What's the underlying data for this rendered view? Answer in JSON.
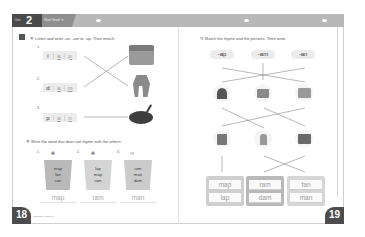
{
  "header": {
    "unit_label": "Unit",
    "unit_number": "2",
    "title": "Short Vowel ⑧"
  },
  "left_page": {
    "page_number": "18",
    "footer_text": "Phonics 1, Book 2",
    "exercise1": {
      "icon": "audio-track-icon",
      "instruction": "⑧ Listen and write -an, -am or -ap. Then match.",
      "items": [
        {
          "number": "1.",
          "first_letter": "l",
          "fill": [
            "a",
            "p"
          ],
          "matches_picture": "dog"
        },
        {
          "number": "2.",
          "first_letter": "d",
          "fill": [
            "a",
            "m"
          ],
          "matches_picture": "map"
        },
        {
          "number": "3.",
          "first_letter": "p",
          "fill": [
            "a",
            "n"
          ],
          "matches_picture": "pan"
        }
      ],
      "pictures": [
        "map",
        "dog",
        "pan"
      ]
    },
    "exercise2": {
      "instruction": "⑨ Write the word that does not rhyme with the others.",
      "columns": [
        {
          "number": "1.",
          "words": [
            "map",
            "fan",
            "can"
          ],
          "answer": "map"
        },
        {
          "number": "2.",
          "words": [
            "lap",
            "map",
            "ram"
          ],
          "answer": "ram"
        },
        {
          "number": "3.",
          "words": [
            "ram",
            "man",
            "dam"
          ],
          "answer": "man"
        }
      ]
    }
  },
  "right_page": {
    "page_number": "19",
    "instruction": "⑩ Match the rhyme and the pictures. Then write.",
    "rhymes": [
      "-ap",
      "-am",
      "-an"
    ],
    "pictures_row1": [
      "fan",
      "dog",
      "map"
    ],
    "pictures_row2": [
      "cat",
      "man",
      "ram"
    ],
    "write_boxes": [
      {
        "words": [
          "map",
          "lap"
        ]
      },
      {
        "words": [
          "ram",
          "dam"
        ]
      },
      {
        "words": [
          "fan",
          "man"
        ]
      }
    ]
  }
}
